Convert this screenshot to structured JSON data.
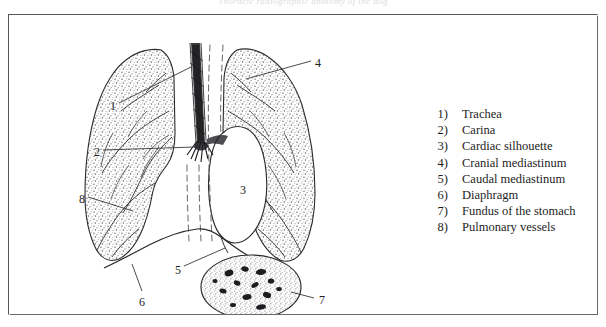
{
  "page": {
    "running_header": "Thoracic radiographic anatomy of the dog",
    "background_color": "#ffffff",
    "ink_color": "#1d1d1d"
  },
  "figure": {
    "border_color": "#56565a",
    "title": ""
  },
  "legend": {
    "items": [
      {
        "number": "1)",
        "label": "Trachea"
      },
      {
        "number": "2)",
        "label": "Carina"
      },
      {
        "number": "3)",
        "label": "Cardiac silhouette"
      },
      {
        "number": "4)",
        "label": "Cranial mediastinum"
      },
      {
        "number": "5)",
        "label": "Caudal mediastinum"
      },
      {
        "number": "6)",
        "label": "Diaphragm"
      },
      {
        "number": "7)",
        "label": "Fundus of the stomach"
      },
      {
        "number": "8)",
        "label": "Pulmonary vessels"
      }
    ]
  },
  "diagram": {
    "callouts": [
      {
        "id": "1",
        "text": "1",
        "x": 101,
        "y": 85,
        "target": "trachea"
      },
      {
        "id": "2",
        "text": "2",
        "x": 85,
        "y": 131,
        "target": "carina"
      },
      {
        "id": "3",
        "text": "3",
        "x": 231,
        "y": 169,
        "target": "cardiac-silhouette"
      },
      {
        "id": "4",
        "text": "4",
        "x": 306,
        "y": 42,
        "target": "cranial-mediastinum"
      },
      {
        "id": "5",
        "text": "5",
        "x": 166,
        "y": 249,
        "target": "caudal-mediastinum"
      },
      {
        "id": "6",
        "text": "6",
        "x": 130,
        "y": 281,
        "target": "diaphragm"
      },
      {
        "id": "7",
        "text": "7",
        "x": 310,
        "y": 279,
        "target": "fundus-of-stomach"
      },
      {
        "id": "8",
        "text": "8",
        "x": 70,
        "y": 178,
        "target": "pulmonary-vessels"
      }
    ]
  }
}
